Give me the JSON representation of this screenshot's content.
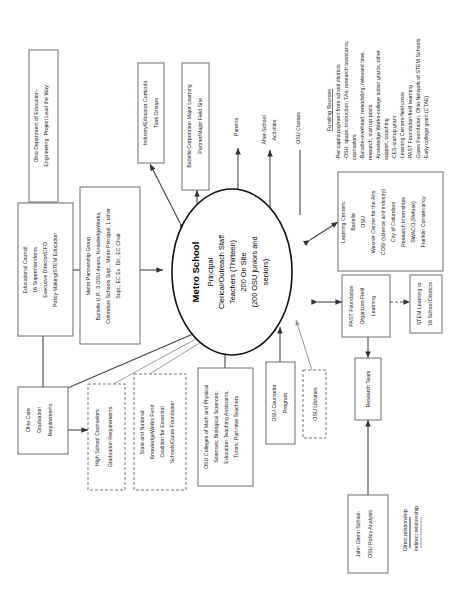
{
  "diagram": {
    "orientation": "rotated-90-ccw"
  },
  "center": {
    "name": "Metro School",
    "lines": [
      "Principal",
      "Clerical/Outreach Staff",
      "Teachers (Thirteen)",
      "200 On Site",
      "(200 OSU juniors and",
      "seniors)"
    ]
  },
  "boxes": {
    "ohio_dept_education": {
      "lines": [
        "Ohio Department of Education-",
        "Engineering: Project Lead the Way"
      ]
    },
    "educational_council": {
      "lines": [
        "Educational Council",
        "16 Superintendents",
        "Executive Director/CFO",
        "Policy-Making/STEM Education"
      ]
    },
    "metro_partnership": {
      "lines": [
        "Metro Partnership Group",
        "Battelle U.P., 3 OSU deans, KnowledgeWorks,",
        "Columbus Schools Supt., Metro Principal, 1 other",
        "Supt., EC Ex. Dir., EC Chair"
      ]
    },
    "ohio_core": {
      "lines": [
        "Ohio Core",
        "Graduation",
        "Requirements"
      ]
    },
    "hs_counselors": {
      "lines": [
        "High School Counselors:",
        "Graduation Requirements"
      ],
      "style": "dashed"
    },
    "state_national": {
      "lines": [
        "State and National:",
        "KnowledgeWorks Fund",
        "Coalition for Essential",
        "Schools/Gates Foundation"
      ],
      "style": "dashed"
    },
    "osu_colleges": {
      "lines": [
        "OSU Colleges of Math and Physical",
        "Sciences; Biological Sciences;",
        "Education-Teaching Assistants,",
        "Tutors, Part-time Teachers"
      ]
    },
    "osu_counselor": {
      "lines": [
        "OSU Counselor",
        "Program"
      ]
    },
    "osu_libraries": {
      "lines": [
        "OSU Libraries"
      ],
      "style": "dashed"
    },
    "industry_educator": {
      "lines": [
        "Industry/Educator Curricula",
        "Task Groups"
      ]
    },
    "battelle_corp": {
      "lines": [
        "Battelle Corporation Major Learning",
        "Partner/Major Field Site"
      ]
    },
    "learning_centers": {
      "lines": [
        "Learning Centers:",
        "Battelle",
        "OSU",
        "Wexner Center for the Arts",
        "COSI (science and industry)",
        "City of Columbus",
        "Research Internships",
        "SWACO (Refuse)",
        "Franklin Conservancy"
      ]
    },
    "past_foundation": {
      "lines": [
        "PAST Foundation",
        "Organizes Field",
        "Learning"
      ]
    },
    "stem_learning": {
      "lines": [
        "STEM Learning to",
        "16 School Districts"
      ]
    },
    "research_team": {
      "lines": [
        "Research Team"
      ]
    },
    "john_glenn": {
      "lines": [
        "John Glenn School-",
        "OSU Policy Analysis"
      ]
    }
  },
  "labels": {
    "parents": "Parents",
    "after_school": [
      "After-School",
      "Activities"
    ],
    "osu_classes": "OSU Classes"
  },
  "funding": {
    "header": "Funding Sources",
    "items": [
      "-Per capita payment from school districts",
      "-OSU: space, instruction, TAs, research assistants,",
      "  counselors",
      "-Battelle-overhead, remodeling, released time,",
      "  research, start up posts",
      "-Knowledge Works-college tuition grants, other",
      "  support, coaching",
      "-CES-startup grant",
      "-Learning Centers-field costs",
      "-PAST Foundation-field learning",
      "-Gates Foundation, Ohio Network of STEM Schools",
      "-Early college grant (CTAE)"
    ]
  },
  "legend": {
    "direct": "Direct relationship",
    "indirect": "Indirect relationship"
  },
  "colors": {
    "box_stroke": "#6f6f6f",
    "ellipse_stroke": "#111111",
    "line": "#444444",
    "indirect_line": "#8f8f8f",
    "background": "#ffffff",
    "text": "#1a1a1a"
  }
}
